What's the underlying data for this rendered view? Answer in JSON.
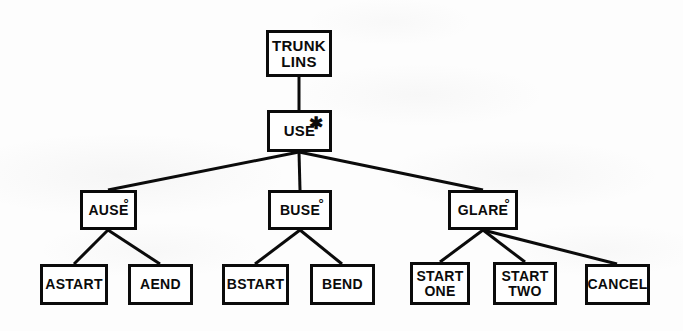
{
  "diagram": {
    "type": "tree",
    "canvas": {
      "width": 683,
      "height": 331
    },
    "colors": {
      "background": "#fdfdfd",
      "stroke": "#0b0b0b",
      "node_fill": "#ffffff"
    },
    "marks": {
      "asterisk": "✱",
      "circle": "°"
    },
    "nodes": [
      {
        "id": "trunk-lins",
        "label": "TRUNK\nLINS",
        "mark": "",
        "level": 0,
        "x": 266,
        "y": 30,
        "w": 66,
        "h": 47,
        "font_size": 15
      },
      {
        "id": "use",
        "label": "USE",
        "mark": "asterisk",
        "level": 1,
        "x": 267,
        "y": 110,
        "w": 65,
        "h": 42,
        "font_size": 15
      },
      {
        "id": "ause",
        "label": "AUSE",
        "mark": "circle",
        "level": 2,
        "x": 80,
        "y": 190,
        "w": 57,
        "h": 40,
        "font_size": 14
      },
      {
        "id": "buse",
        "label": "BUSE",
        "mark": "circle",
        "level": 2,
        "x": 268,
        "y": 190,
        "w": 64,
        "h": 40,
        "font_size": 14
      },
      {
        "id": "glare",
        "label": "GLARE",
        "mark": "circle",
        "level": 2,
        "x": 448,
        "y": 190,
        "w": 70,
        "h": 40,
        "font_size": 14
      },
      {
        "id": "astart",
        "label": "ASTART",
        "mark": "",
        "level": 3,
        "x": 40,
        "y": 264,
        "w": 68,
        "h": 41,
        "font_size": 14
      },
      {
        "id": "aend",
        "label": "AEND",
        "mark": "",
        "level": 3,
        "x": 128,
        "y": 264,
        "w": 65,
        "h": 41,
        "font_size": 14
      },
      {
        "id": "bstart",
        "label": "BSTART",
        "mark": "",
        "level": 3,
        "x": 222,
        "y": 264,
        "w": 67,
        "h": 41,
        "font_size": 14
      },
      {
        "id": "bend",
        "label": "BEND",
        "mark": "",
        "level": 3,
        "x": 310,
        "y": 264,
        "w": 65,
        "h": 41,
        "font_size": 14
      },
      {
        "id": "start-one",
        "label": "START\nONE",
        "mark": "",
        "level": 3,
        "x": 410,
        "y": 262,
        "w": 60,
        "h": 43,
        "font_size": 14
      },
      {
        "id": "start-two",
        "label": "START\nTWO",
        "mark": "",
        "level": 3,
        "x": 493,
        "y": 262,
        "w": 64,
        "h": 43,
        "font_size": 14
      },
      {
        "id": "cancel",
        "label": "CANCEL",
        "mark": "",
        "level": 3,
        "x": 585,
        "y": 264,
        "w": 65,
        "h": 41,
        "font_size": 14
      }
    ],
    "edges": [
      {
        "from": "trunk-lins",
        "to": "use",
        "x1": 299,
        "y1": 77,
        "x2": 299,
        "y2": 110
      },
      {
        "from": "use",
        "to": "ause",
        "x1": 299,
        "y1": 152,
        "x2": 108,
        "y2": 190
      },
      {
        "from": "use",
        "to": "buse",
        "x1": 299,
        "y1": 152,
        "x2": 300,
        "y2": 190
      },
      {
        "from": "use",
        "to": "glare",
        "x1": 299,
        "y1": 152,
        "x2": 483,
        "y2": 190
      },
      {
        "from": "ause",
        "to": "astart",
        "x1": 108,
        "y1": 230,
        "x2": 74,
        "y2": 264
      },
      {
        "from": "ause",
        "to": "aend",
        "x1": 108,
        "y1": 230,
        "x2": 160,
        "y2": 264
      },
      {
        "from": "buse",
        "to": "bstart",
        "x1": 300,
        "y1": 230,
        "x2": 255,
        "y2": 264
      },
      {
        "from": "buse",
        "to": "bend",
        "x1": 300,
        "y1": 230,
        "x2": 342,
        "y2": 264
      },
      {
        "from": "glare",
        "to": "start-one",
        "x1": 483,
        "y1": 230,
        "x2": 440,
        "y2": 262
      },
      {
        "from": "glare",
        "to": "start-two",
        "x1": 483,
        "y1": 230,
        "x2": 525,
        "y2": 262
      },
      {
        "from": "glare",
        "to": "cancel",
        "x1": 483,
        "y1": 230,
        "x2": 617,
        "y2": 264
      }
    ]
  }
}
